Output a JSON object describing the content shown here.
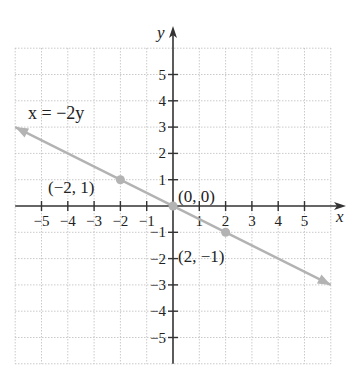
{
  "chart_data": {
    "type": "line",
    "title": "",
    "xlabel": "x",
    "ylabel": "y",
    "xlim": [
      -6,
      6
    ],
    "ylim": [
      -6,
      6
    ],
    "grid": true,
    "x_ticks": [
      -5,
      -4,
      -3,
      -2,
      -1,
      1,
      2,
      3,
      4,
      5
    ],
    "y_ticks": [
      -5,
      -4,
      -3,
      -2,
      -1,
      1,
      2,
      3,
      4,
      5
    ],
    "x_tick_labels": [
      "−5",
      "−4",
      "−3",
      "−2",
      "−1",
      "1",
      "2",
      "3",
      "4",
      "5"
    ],
    "y_tick_labels": [
      "−5",
      "−4",
      "−3",
      "−2",
      "−1",
      "1",
      "2",
      "3",
      "4",
      "5"
    ],
    "series": [
      {
        "name": "x = −2y",
        "equation": "x = −2y",
        "x": [
          -6,
          6
        ],
        "y": [
          3,
          -3
        ],
        "arrows_both_ends": true,
        "color": "#b3b3b3"
      }
    ],
    "points": [
      {
        "x": -2,
        "y": 1,
        "label": "(−2, 1)"
      },
      {
        "x": 0,
        "y": 0,
        "label": "(0, 0)"
      },
      {
        "x": 2,
        "y": -1,
        "label": "(2, −1)"
      }
    ],
    "annotations": [
      {
        "text": "x = −2y",
        "near": [
          -5,
          3.5
        ]
      }
    ]
  },
  "colors": {
    "axis": "#333333",
    "grid": "#bdbdbd",
    "line": "#b3b3b3",
    "point": "#b3b3b3",
    "text": "#222222"
  }
}
